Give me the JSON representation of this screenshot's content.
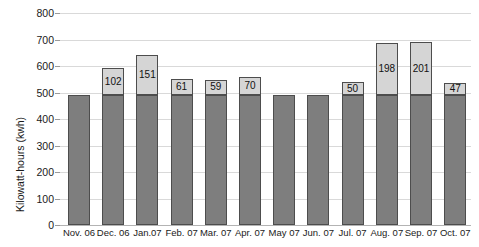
{
  "chart_data": {
    "type": "bar",
    "stacked": true,
    "title": "",
    "xlabel": "",
    "ylabel": "Kilowatt-hours (kwh)",
    "ylim": [
      0,
      800
    ],
    "yticks": [
      0,
      100,
      200,
      300,
      400,
      500,
      600,
      700,
      800
    ],
    "ytick_labels": [
      "0",
      "100",
      "200",
      "300",
      "400",
      "500",
      "600",
      "700",
      "800"
    ],
    "grid": true,
    "legend": "none",
    "categories": [
      "Nov. 06",
      "Dec. 06",
      "Jan.07",
      "Feb. 07",
      "Mar. 07",
      "Apr. 07",
      "May 07",
      "Jun. 07",
      "Jul. 07",
      "Aug. 07",
      "Sep. 07",
      "Oct. 07"
    ],
    "series": [
      {
        "name": "base",
        "color": "#7e7e7e",
        "values": [
          490,
          490,
          490,
          490,
          490,
          490,
          490,
          490,
          490,
          490,
          490,
          490
        ]
      },
      {
        "name": "increment",
        "color": "#d5d5d5",
        "values": [
          0,
          102,
          151,
          61,
          59,
          70,
          0,
          0,
          50,
          198,
          201,
          47
        ],
        "labels": [
          "",
          "102",
          "151",
          "61",
          "59",
          "70",
          "",
          "",
          "50",
          "198",
          "201",
          "47"
        ]
      }
    ],
    "totals": [
      490,
      592,
      641,
      551,
      549,
      560,
      490,
      490,
      540,
      688,
      691,
      537
    ]
  }
}
